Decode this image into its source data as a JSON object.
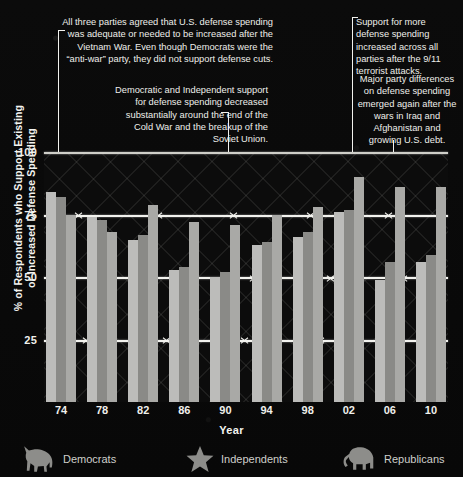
{
  "chart_data": {
    "type": "bar",
    "title": "",
    "xlabel": "Year",
    "ylabel": "% of Respondents who Support Existing or Increased Defense Spending",
    "categories": [
      "74",
      "78",
      "82",
      "86",
      "90",
      "94",
      "98",
      "02",
      "06",
      "10"
    ],
    "ylim": [
      0,
      100
    ],
    "yticks": [
      "100",
      "75",
      "50",
      "25"
    ],
    "ytick_values": [
      100,
      75,
      50,
      25
    ],
    "grid": true,
    "legend_position": "bottom",
    "series": [
      {
        "name": "Democrats",
        "color": "#bcbcba",
        "icon": "donkey-icon",
        "values": [
          84,
          74,
          65,
          53,
          50,
          63,
          66,
          76,
          49,
          56
        ]
      },
      {
        "name": "Independents",
        "color": "#8a8a87",
        "icon": "star-icon",
        "values": [
          82,
          73,
          67,
          54,
          52,
          64,
          68,
          77,
          56,
          59
        ]
      },
      {
        "name": "Republicans",
        "color": "#a9a9a6",
        "icon": "elephant-icon",
        "values": [
          75,
          68,
          79,
          72,
          71,
          75,
          78,
          90,
          86,
          86
        ]
      }
    ]
  },
  "annotations": [
    {
      "id": "vietnam",
      "text": "All three parties agreed that U.S. defense spending was adequate or needed to be increased after the Vietnam War. Even though Democrats were the “anti-war” party, they did not support defense cuts."
    },
    {
      "id": "cold-war",
      "text": "Democratic and Independent support for defense spending decreased substantially around the end of the Cold War and the breakup of the Soviet Union."
    },
    {
      "id": "nine-eleven",
      "text": "Support for more defense spending increased across all parties after the 9/11 terrorist attacks."
    },
    {
      "id": "iraq-afghanistan",
      "text": "Major party differences on defense spending emerged again after the wars in Iraq and Afghanistan and growing U.S. debt."
    }
  ],
  "legend": {
    "democrats": "Democrats",
    "independents": "Independents",
    "republicans": "Republicans"
  },
  "axis": {
    "x_title": "Year",
    "y_title": "% of Respondents who Support Existing or Increased Defense Spending"
  }
}
